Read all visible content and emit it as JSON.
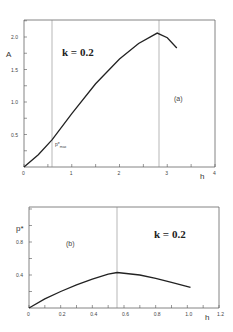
{
  "chart_data": [
    {
      "type": "line",
      "panel": "(a)",
      "title": "",
      "annotation": "k = 0.2",
      "xlabel": "h",
      "ylabel": "A",
      "xlim": [
        0,
        4
      ],
      "ylim": [
        0,
        2.3
      ],
      "xticks": [
        0,
        1,
        2,
        3,
        4
      ],
      "xtick_labels": [
        "0",
        "1",
        "2",
        "3",
        "4"
      ],
      "yticks": [
        0.5,
        1.0,
        1.5,
        2.0
      ],
      "ytick_labels": [
        "0.5",
        "1.0",
        "1.5",
        "2.0"
      ],
      "vertical_lines": [
        0.59,
        2.83
      ],
      "point_label": {
        "text": "p*",
        "sub": "max",
        "x": 0.59,
        "y": 0.42
      },
      "series": [
        {
          "name": "A(h)",
          "x": [
            0,
            0.3,
            0.59,
            1.0,
            1.5,
            2.0,
            2.4,
            2.79,
            3.0,
            3.2
          ],
          "y": [
            0,
            0.19,
            0.42,
            0.82,
            1.28,
            1.66,
            1.9,
            2.06,
            1.99,
            1.83
          ]
        }
      ],
      "grid": false
    },
    {
      "type": "line",
      "panel": "(b)",
      "title": "",
      "annotation": "k = 0.2",
      "xlabel": "h",
      "ylabel": "p*",
      "xlim": [
        0,
        1.2
      ],
      "ylim": [
        0,
        1.2
      ],
      "xticks": [
        0,
        0.2,
        0.4,
        0.6,
        0.8,
        1.0,
        1.2
      ],
      "xtick_labels": [
        "0",
        "0.2",
        "0.4",
        "0.6",
        "0.8",
        "1.0",
        "1.2"
      ],
      "yticks": [
        0.4,
        0.8
      ],
      "ytick_labels": [
        "0.4",
        "0.8"
      ],
      "vertical_lines": [
        0.557
      ],
      "series": [
        {
          "name": "p*(h)",
          "x": [
            0,
            0.1,
            0.2,
            0.3,
            0.4,
            0.5,
            0.557,
            0.7,
            0.8,
            0.9,
            1.02
          ],
          "y": [
            0,
            0.11,
            0.2,
            0.28,
            0.35,
            0.41,
            0.43,
            0.4,
            0.36,
            0.31,
            0.25
          ]
        }
      ],
      "grid": false
    }
  ],
  "panel_a": {
    "y_axis_label": "A",
    "x_axis_label": "h",
    "k_label": "k = 0.2",
    "panel_label": "(a)",
    "point_label_main": "p*",
    "point_label_sub": "max",
    "x_ticks": [
      "0",
      "1",
      "2",
      "3",
      "4"
    ],
    "y_ticks": [
      "0.5",
      "1.0",
      "1.5",
      "2.0"
    ]
  },
  "panel_b": {
    "y_axis_label": "p*",
    "x_axis_label": "h",
    "k_label": "k = 0.2",
    "panel_label": "(b)",
    "x_ticks": [
      "0",
      "0.2",
      "0.4",
      "0.6",
      "0.8",
      "1.0",
      "1.2"
    ],
    "y_ticks": [
      "0.4",
      "0.8"
    ]
  }
}
